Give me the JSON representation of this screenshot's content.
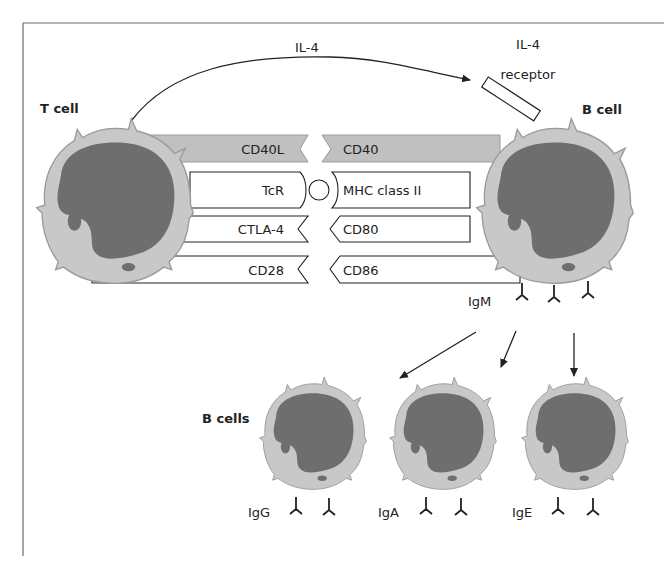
{
  "colors": {
    "cytoplasm": "#c8c8c8",
    "nucleus": "#6e6e6e",
    "cd40_bar": "#c0c0c0",
    "stroke": "#222222",
    "frame": "#6a6a6a"
  },
  "labels": {
    "il4": "IL-4",
    "il4_receptor_line1": "IL-4",
    "il4_receptor_line2": "receptor",
    "t_cell": "T cell",
    "b_cell": "B cell",
    "b_cells": "B cells",
    "igm": "IgM"
  },
  "t_cell_molecules": [
    {
      "label": "CD40L"
    },
    {
      "label": "TcR"
    },
    {
      "label": "CTLA-4"
    },
    {
      "label": "CD28"
    }
  ],
  "b_cell_molecules": [
    {
      "label": "CD40"
    },
    {
      "label": "MHC class II"
    },
    {
      "label": "CD80"
    },
    {
      "label": "CD86"
    }
  ],
  "daughter_cells": [
    {
      "isotype": "IgG"
    },
    {
      "isotype": "IgA"
    },
    {
      "isotype": "IgE"
    }
  ]
}
